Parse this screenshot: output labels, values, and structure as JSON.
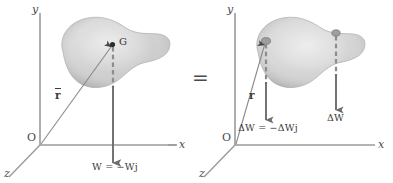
{
  "figure": {
    "equals_sign": "=",
    "background_color": "#ffffff",
    "ink_color": "#3a3a3a",
    "body_fill_color": "#c9c9c9",
    "body_highlight_color": "#e8e8e8",
    "arrow_color": "#6b6b6b"
  },
  "left_panel": {
    "name": "total-weight-diagram",
    "axes": {
      "y_label": "y",
      "x_label": "x",
      "z_label": "z",
      "origin_label": "O"
    },
    "center_of_gravity_label": "G",
    "position_vector_label": "r",
    "position_vector_has_overbar": true,
    "weight_label": "W = −Wj"
  },
  "right_panel": {
    "name": "elemental-weights-diagram",
    "axes": {
      "y_label": "y",
      "x_label": "x",
      "z_label": "z",
      "origin_label": "O"
    },
    "position_vector_label": "r",
    "position_vector_has_overbar": false,
    "element_weight_label": "ΔW = −ΔWj",
    "second_element_label": "ΔW"
  }
}
